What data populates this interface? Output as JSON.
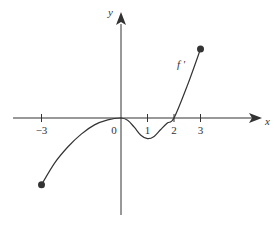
{
  "chart_data": {
    "type": "line",
    "title": "",
    "xlabel": "x",
    "ylabel": "y",
    "curve_label": "f '",
    "x_ticks": [
      {
        "value": -3,
        "label": "−3"
      },
      {
        "value": 0,
        "label": "0"
      },
      {
        "value": 1,
        "label": "1"
      },
      {
        "value": 2,
        "label": "2"
      },
      {
        "value": 3,
        "label": "3"
      }
    ],
    "xlim": [
      -4.5,
      5.2
    ],
    "ylim": [
      -4.2,
      5.1
    ],
    "grid": false,
    "series": [
      {
        "name": "f '",
        "x": [
          -3,
          -2.5,
          -2,
          -1.5,
          -1,
          -0.5,
          0,
          0.25,
          0.5,
          0.75,
          1,
          1.25,
          1.5,
          1.75,
          2,
          2.5,
          3
        ],
        "y": [
          -2.9,
          -1.95,
          -1.25,
          -0.7,
          -0.3,
          -0.08,
          0,
          -0.1,
          -0.4,
          -0.75,
          -0.9,
          -0.8,
          -0.5,
          -0.22,
          0,
          1.4,
          3.0
        ],
        "endpoints": [
          {
            "x": -3,
            "y": -2.9,
            "closed": true
          },
          {
            "x": 3,
            "y": 3.0,
            "closed": true
          }
        ]
      }
    ]
  },
  "colors": {
    "axis": "#333333",
    "curve": "#333333",
    "background": "#ffffff"
  }
}
